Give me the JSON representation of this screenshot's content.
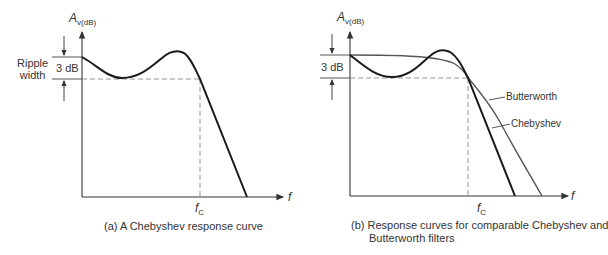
{
  "panel_a": {
    "y_axis_label_main": "A",
    "y_axis_label_sub": "v(dB)",
    "x_axis_label": "f",
    "fc_label_main": "f",
    "fc_label_sub": "C",
    "ripple_label_line1": "Ripple",
    "ripple_label_line2": "width",
    "db_label": "3 dB",
    "caption": "(a)  A Chebyshev response curve"
  },
  "panel_b": {
    "y_axis_label_main": "A",
    "y_axis_label_sub": "v(dB)",
    "x_axis_label": "f",
    "fc_label_main": "f",
    "fc_label_sub": "C",
    "db_label": "3 dB",
    "butterworth_label": "Butterworth",
    "chebyshev_label": "Chebyshev",
    "caption_line1": "(b)  Response curves for comparable Chebyshev and",
    "caption_line2": "Butterworth filters"
  },
  "colors": {
    "chebyshev_curve": "#1a1a1a",
    "butterworth_curve": "#555555",
    "axes": "#333333",
    "dashed": "#888888"
  }
}
